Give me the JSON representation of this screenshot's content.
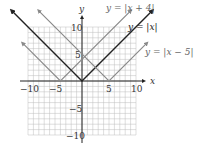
{
  "chart_data": {
    "type": "line",
    "title": "",
    "xlabel": "x",
    "ylabel": "y",
    "xlim": [
      -10,
      10
    ],
    "ylim": [
      -10,
      10
    ],
    "grid": true,
    "grid_step": 1,
    "x_ticks": [
      -10,
      -5,
      5,
      10
    ],
    "y_ticks": [
      10,
      5,
      -5,
      -10
    ],
    "x_tick_labels": [
      "−10",
      "−5",
      "5",
      "10"
    ],
    "y_tick_labels": [
      "10",
      "5",
      "−5",
      "−10"
    ],
    "series": [
      {
        "name": "y = |x + 4|",
        "label": "y = |x + 4|",
        "vertex": [
          -4,
          0
        ],
        "x": [
          -11,
          -4,
          9
        ],
        "y": [
          7,
          0,
          13
        ],
        "color": "#8a8a8a"
      },
      {
        "name": "y = |x|",
        "label": "y = |x|",
        "vertex": [
          0,
          0
        ],
        "x": [
          -13,
          0,
          13
        ],
        "y": [
          13,
          0,
          13
        ],
        "color": "#222222"
      },
      {
        "name": "y = |x - 5|",
        "label": "y = |x − 5|",
        "vertex": [
          5,
          0
        ],
        "x": [
          -8,
          5,
          12
        ],
        "y": [
          13,
          0,
          7
        ],
        "color": "#8a8a8a"
      }
    ],
    "legend_position": "annotations-top-right"
  },
  "labels": {
    "x_axis": "x",
    "y_axis": "y",
    "eq1": "y = |x + 4|",
    "eq2": "y = |x|",
    "eq3": "y = |x − 5|",
    "tick_x_neg10": "−10",
    "tick_x_neg5": "−5",
    "tick_x_5": "5",
    "tick_x_10": "10",
    "tick_y_10": "10",
    "tick_y_5": "5",
    "tick_y_neg5": "−5",
    "tick_y_neg10": "−10"
  }
}
